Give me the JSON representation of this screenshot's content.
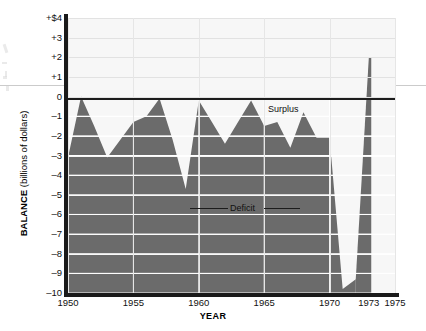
{
  "chart_data": {
    "type": "area",
    "title": "",
    "xlabel": "YEAR",
    "ylabel": "BALANCE (billions of dollars)",
    "ylabel_bold_part": "BALANCE",
    "ylabel_rest": " (billions of dollars)",
    "xlim": [
      1950,
      1975
    ],
    "ylim": [
      -10,
      4
    ],
    "grid": true,
    "legend": "none",
    "y_tick_labels": [
      "+$4",
      "+3",
      "+2",
      "+1",
      "0",
      "–1",
      "–2",
      "–3",
      "–4",
      "–5",
      "–6",
      "–7",
      "–8",
      "–9",
      "–10"
    ],
    "y_tick_values": [
      4,
      3,
      2,
      1,
      0,
      -1,
      -2,
      -3,
      -4,
      -5,
      -6,
      -7,
      -8,
      -9,
      -10
    ],
    "x_tick_labels": [
      "1950",
      "1955",
      "1960",
      "1965",
      "1970",
      "1973",
      "1975"
    ],
    "x_tick_values": [
      1950,
      1955,
      1960,
      1965,
      1970,
      1973,
      1975
    ],
    "annotations": [
      {
        "text": "Surplus",
        "x": 1960.1,
        "y": 0.62
      },
      {
        "text": "Deficit",
        "x": 1957.3,
        "y": -4.3
      }
    ],
    "series_name": "Federal budget balance",
    "x": [
      1950,
      1951,
      1952,
      1953,
      1954,
      1955,
      1956,
      1957,
      1958,
      1959,
      1960,
      1961,
      1962,
      1963,
      1964,
      1965,
      1966,
      1967,
      1968,
      1969,
      1970,
      1971,
      1972,
      1973
    ],
    "values": [
      -3.1,
      0.0,
      -1.5,
      -3.1,
      -2.2,
      -1.3,
      -1.0,
      -0.1,
      -2.2,
      -4.7,
      -0.2,
      -1.3,
      -2.4,
      -1.3,
      -0.2,
      -1.5,
      -1.3,
      -2.6,
      -0.8,
      -2.1,
      -2.1,
      -9.8,
      -9.3,
      2.0
    ],
    "fill_color": "#6b6b6b",
    "zero_line_color": "#1c1c1c",
    "plot_background": "#f7f7f7"
  }
}
